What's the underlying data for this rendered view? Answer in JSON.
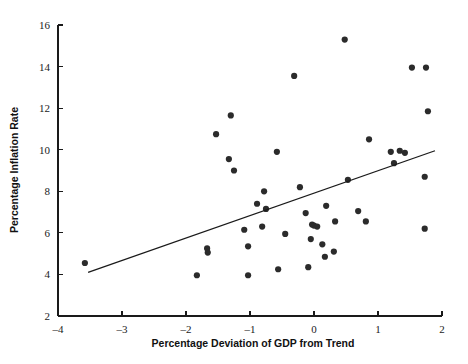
{
  "chart_data": {
    "type": "scatter",
    "title": "",
    "xlabel": "Percentage Deviation of GDP from Trend",
    "ylabel": "Percentage Inflation Rate",
    "xlim": [
      -4,
      2
    ],
    "ylim": [
      2,
      16
    ],
    "xticks": [
      -4,
      -3,
      -2,
      -1,
      0,
      1,
      2
    ],
    "xtick_labels": [
      "–4",
      "–3",
      "–2",
      "–1",
      "0",
      "1",
      "2"
    ],
    "yticks": [
      2,
      4,
      6,
      8,
      10,
      12,
      14,
      16
    ],
    "ytick_labels": [
      "2",
      "4",
      "6",
      "8",
      "10",
      "12",
      "14",
      "16"
    ],
    "grid": false,
    "legend": null,
    "marker_color": "#2b2b2b",
    "line_color": "#1a1a1a",
    "axis_color": "#1a1a1a",
    "points": [
      {
        "x": -3.58,
        "y": 4.55
      },
      {
        "x": -1.83,
        "y": 3.96
      },
      {
        "x": -1.67,
        "y": 5.25
      },
      {
        "x": -1.66,
        "y": 5.05
      },
      {
        "x": -1.53,
        "y": 10.75
      },
      {
        "x": -1.33,
        "y": 9.55
      },
      {
        "x": -1.3,
        "y": 11.65
      },
      {
        "x": -1.25,
        "y": 9.0
      },
      {
        "x": -1.09,
        "y": 6.15
      },
      {
        "x": -1.03,
        "y": 5.35
      },
      {
        "x": -1.03,
        "y": 3.96
      },
      {
        "x": -0.89,
        "y": 7.4
      },
      {
        "x": -0.81,
        "y": 6.3
      },
      {
        "x": -0.78,
        "y": 8.0
      },
      {
        "x": -0.75,
        "y": 7.15
      },
      {
        "x": -0.58,
        "y": 9.9
      },
      {
        "x": -0.56,
        "y": 4.25
      },
      {
        "x": -0.45,
        "y": 5.95
      },
      {
        "x": -0.31,
        "y": 13.55
      },
      {
        "x": -0.22,
        "y": 8.2
      },
      {
        "x": -0.13,
        "y": 6.95
      },
      {
        "x": -0.09,
        "y": 4.35
      },
      {
        "x": -0.05,
        "y": 5.7
      },
      {
        "x": -0.03,
        "y": 6.4
      },
      {
        "x": 0.0,
        "y": 6.35
      },
      {
        "x": 0.05,
        "y": 6.3
      },
      {
        "x": 0.13,
        "y": 5.45
      },
      {
        "x": 0.17,
        "y": 4.85
      },
      {
        "x": 0.19,
        "y": 7.3
      },
      {
        "x": 0.31,
        "y": 5.1
      },
      {
        "x": 0.33,
        "y": 6.55
      },
      {
        "x": 0.48,
        "y": 15.3
      },
      {
        "x": 0.53,
        "y": 8.55
      },
      {
        "x": 0.69,
        "y": 7.05
      },
      {
        "x": 0.81,
        "y": 6.55
      },
      {
        "x": 0.86,
        "y": 10.5
      },
      {
        "x": 1.2,
        "y": 9.9
      },
      {
        "x": 1.25,
        "y": 9.35
      },
      {
        "x": 1.34,
        "y": 9.95
      },
      {
        "x": 1.42,
        "y": 9.85
      },
      {
        "x": 1.53,
        "y": 13.95
      },
      {
        "x": 1.75,
        "y": 13.95
      },
      {
        "x": 1.73,
        "y": 8.7
      },
      {
        "x": 1.78,
        "y": 11.85
      },
      {
        "x": 1.73,
        "y": 6.2
      }
    ],
    "fit_line": {
      "x0": -3.53,
      "y0": 4.1,
      "x1": 1.89,
      "y1": 9.95
    }
  }
}
